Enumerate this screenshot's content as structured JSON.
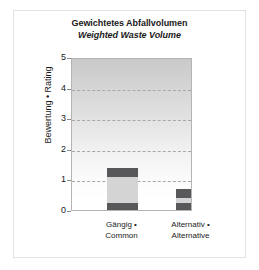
{
  "chart_data": {
    "type": "bar",
    "stacked": true,
    "title": "Gewichtetes Abfallvolumen",
    "subtitle": "Weighted Waste Volume",
    "xlabel": "",
    "ylabel": "Bewertung • Rating",
    "ylim": [
      0,
      5
    ],
    "yticks": [
      0,
      1,
      2,
      3,
      4,
      5
    ],
    "ytick_labels": [
      "0",
      "1",
      "2",
      "3",
      "4",
      "5"
    ],
    "grid": true,
    "gridlines_at": [
      1,
      2,
      3,
      4
    ],
    "legend": "none",
    "categories": [
      "Gängig • Common",
      "Alternativ • Alternative"
    ],
    "category_lines": [
      [
        "Gängig •",
        "Common"
      ],
      [
        "Alternativ •",
        "Alternative"
      ]
    ],
    "series": [
      {
        "name": "bottom-segment",
        "color": "#58585a",
        "values": [
          0.28,
          0.29
        ]
      },
      {
        "name": "middle-segment",
        "color": "#d4d4d4",
        "values": [
          0.85,
          0.16
        ]
      },
      {
        "name": "top-segment",
        "color": "#58585a",
        "values": [
          0.3,
          0.31
        ]
      }
    ],
    "totals": [
      1.43,
      0.76
    ]
  },
  "colors": {
    "dark_segment": "#58585a",
    "light_segment": "#d4d4d4",
    "plot_border": "#b4b4b4",
    "gridline": "#a8a8a8",
    "frame_border": "#e2e2e2",
    "text": "#1a1a1a",
    "background": "#ffffff"
  }
}
